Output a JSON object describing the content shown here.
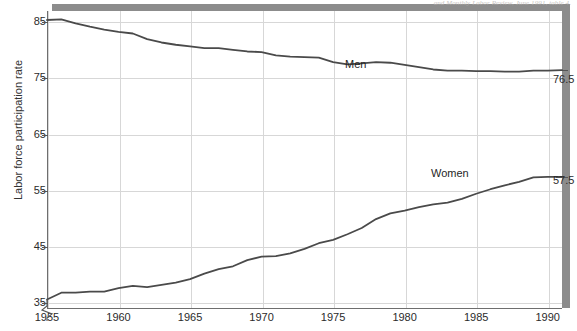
{
  "figure": {
    "source_credit": "and Monthly Labor Review, June 1991, table 4.",
    "y_axis_title": "Labor force participation rate"
  },
  "chart_data": {
    "type": "line",
    "title": "",
    "subtitle": "",
    "xlabel": "",
    "ylabel": "Labor force participation rate",
    "xlim": [
      1955,
      1991
    ],
    "ylim": [
      34,
      87
    ],
    "grid": true,
    "legend_position": "inline-on-series",
    "x_ticks": [
      1955,
      1960,
      1965,
      1970,
      1975,
      1980,
      1985,
      1990
    ],
    "y_ticks": [
      35,
      45,
      55,
      65,
      75,
      85
    ],
    "y_axis_break": true,
    "annotations": [
      {
        "name": "men-end-value",
        "text": "76.5",
        "x": 1991,
        "y": 76.5
      },
      {
        "name": "women-end-value",
        "text": "57.5",
        "x": 1991,
        "y": 57.5
      }
    ],
    "series": [
      {
        "name": "Men",
        "label": "Men",
        "color": "#4a4a4a",
        "x": [
          1955,
          1956,
          1957,
          1958,
          1959,
          1960,
          1961,
          1962,
          1963,
          1964,
          1965,
          1966,
          1967,
          1968,
          1969,
          1970,
          1971,
          1972,
          1973,
          1974,
          1975,
          1976,
          1977,
          1978,
          1979,
          1980,
          1981,
          1982,
          1983,
          1984,
          1985,
          1986,
          1987,
          1988,
          1989,
          1990,
          1991
        ],
        "values": [
          85.4,
          85.5,
          84.8,
          84.2,
          83.7,
          83.3,
          83.0,
          82.0,
          81.4,
          81.0,
          80.7,
          80.4,
          80.4,
          80.1,
          79.8,
          79.7,
          79.1,
          78.9,
          78.8,
          78.7,
          77.9,
          77.5,
          77.7,
          77.9,
          77.8,
          77.4,
          77.0,
          76.6,
          76.4,
          76.4,
          76.3,
          76.3,
          76.2,
          76.2,
          76.4,
          76.4,
          76.5
        ]
      },
      {
        "name": "Women",
        "label": "Women",
        "color": "#4a4a4a",
        "x": [
          1955,
          1956,
          1957,
          1958,
          1959,
          1960,
          1961,
          1962,
          1963,
          1964,
          1965,
          1966,
          1967,
          1968,
          1969,
          1970,
          1971,
          1972,
          1973,
          1974,
          1975,
          1976,
          1977,
          1978,
          1979,
          1980,
          1981,
          1982,
          1983,
          1984,
          1985,
          1986,
          1987,
          1988,
          1989,
          1990,
          1991
        ],
        "values": [
          35.7,
          36.9,
          36.9,
          37.1,
          37.1,
          37.7,
          38.1,
          37.9,
          38.3,
          38.7,
          39.3,
          40.3,
          41.1,
          41.6,
          42.7,
          43.3,
          43.4,
          43.9,
          44.7,
          45.7,
          46.3,
          47.3,
          48.4,
          50.0,
          51.0,
          51.5,
          52.1,
          52.6,
          52.9,
          53.6,
          54.5,
          55.3,
          56.0,
          56.6,
          57.4,
          57.5,
          57.5
        ]
      }
    ]
  }
}
